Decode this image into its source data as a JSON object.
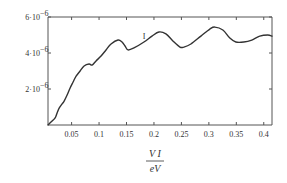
{
  "chart_data": {
    "type": "line",
    "title": "",
    "xlabel_numerator": "V I",
    "xlabel_denominator": "eV",
    "ylabel": "",
    "xlim": [
      0.007,
      0.415
    ],
    "ylim": [
      0,
      6e-06
    ],
    "grid": false,
    "legend": "none",
    "x_ticks": [
      0.05,
      0.1,
      0.15,
      0.2,
      0.25,
      0.3,
      0.35,
      0.4
    ],
    "x_tick_labels": [
      "0.05",
      "0.1",
      "0.15",
      "0.2",
      "0.25",
      "0.3",
      "0.35",
      "0.4"
    ],
    "y_ticks": [
      2e-06,
      4e-06,
      6e-06
    ],
    "y_tick_labels": [
      {
        "mantissa": "2·10",
        "exponent": "−6"
      },
      {
        "mantissa": "4·10",
        "exponent": "−6"
      },
      {
        "mantissa": "6·10",
        "exponent": "−6"
      }
    ],
    "annotation": {
      "text": "I",
      "x": 0.182,
      "y": 4.8e-06
    },
    "series": [
      {
        "name": "curve",
        "estimated": true,
        "x": [
          0.007,
          0.0145,
          0.02,
          0.0236,
          0.0273,
          0.0327,
          0.0364,
          0.0418,
          0.0473,
          0.0527,
          0.0582,
          0.0655,
          0.0727,
          0.0818,
          0.0873,
          0.0945,
          0.1036,
          0.1127,
          0.1218,
          0.1345,
          0.1418,
          0.1473,
          0.1527,
          0.1636,
          0.1818,
          0.1964,
          0.2091,
          0.2218,
          0.2345,
          0.2473,
          0.2545,
          0.2673,
          0.2855,
          0.3018,
          0.3109,
          0.3255,
          0.3382,
          0.3491,
          0.3636,
          0.3782,
          0.3927,
          0.4073,
          0.415
        ],
        "y": [
          0.0,
          2.2e-07,
          3.9e-07,
          6.7e-07,
          9.4e-07,
          1.17e-06,
          1.33e-06,
          1.67e-06,
          2.06e-06,
          2.39e-06,
          2.72e-06,
          3e-06,
          3.28e-06,
          3.39e-06,
          3.33e-06,
          3.56e-06,
          3.83e-06,
          4.17e-06,
          4.5e-06,
          4.72e-06,
          4.61e-06,
          4.39e-06,
          4.17e-06,
          4.28e-06,
          4.61e-06,
          4.94e-06,
          5.17e-06,
          5.06e-06,
          4.67e-06,
          4.33e-06,
          4.33e-06,
          4.5e-06,
          4.94e-06,
          5.33e-06,
          5.44e-06,
          5.28e-06,
          4.83e-06,
          4.61e-06,
          4.61e-06,
          4.72e-06,
          4.94e-06,
          5e-06,
          4.94e-06
        ]
      }
    ]
  }
}
